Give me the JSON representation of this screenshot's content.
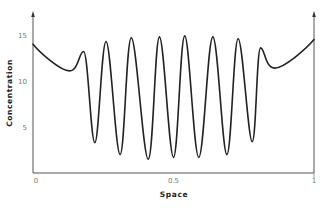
{
  "chart_data": {
    "type": "line",
    "title": "",
    "xlabel": "Space",
    "ylabel": "Concentration",
    "xlim": [
      0,
      1
    ],
    "ylim": [
      0,
      16.5
    ],
    "xticks": [
      {
        "value": 0,
        "label": "0"
      },
      {
        "value": 0.5,
        "label": "0.5"
      },
      {
        "value": 1,
        "label": "1"
      }
    ],
    "yticks": [
      {
        "value": 5,
        "label": "5"
      },
      {
        "value": 10,
        "label": "10"
      },
      {
        "value": 15,
        "label": "15"
      }
    ],
    "grid": false,
    "legend": null,
    "series": [
      {
        "name": "concentration",
        "color": "#222222",
        "x": [
          0.0,
          0.13,
          0.18,
          0.22,
          0.26,
          0.31,
          0.35,
          0.41,
          0.45,
          0.5,
          0.54,
          0.59,
          0.64,
          0.69,
          0.73,
          0.78,
          0.81,
          0.86,
          1.0
        ],
        "y": [
          14.0,
          11.1,
          13.2,
          3.3,
          14.3,
          2.0,
          14.7,
          1.5,
          14.8,
          1.7,
          14.9,
          1.7,
          14.8,
          2.0,
          14.6,
          3.4,
          13.6,
          11.4,
          14.5
        ]
      }
    ]
  }
}
